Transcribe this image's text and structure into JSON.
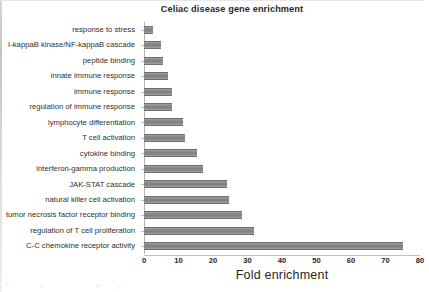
{
  "chart_data": {
    "type": "bar",
    "orientation": "horizontal",
    "title": "Celiac disease gene enrichment",
    "xlabel": "Fold enrichment",
    "ylabel": "",
    "xlim": [
      0,
      80
    ],
    "xticks": [
      0,
      10,
      20,
      30,
      40,
      50,
      60,
      70,
      80
    ],
    "grid": false,
    "legend": null,
    "bar_color": "#8a8a8a",
    "categories": [
      "response to stress",
      "I-kappaB kinase/NF-kappaB cascade",
      "peptide binding",
      "innate immune response",
      "immune response",
      "regulation of immune response",
      "lymphocyte differentiation",
      "T cell activation",
      "cytokine binding",
      "interferon-gamma production",
      "JAK-STAT cascade",
      "natural killer cell activation",
      "tumor necrosis factor receptor binding",
      "regulation of T cell proliferation",
      "C-C chemokine receptor activity"
    ],
    "values": [
      2.5,
      5,
      5.5,
      7,
      8,
      8.2,
      11.2,
      12,
      15.5,
      17,
      24,
      24.5,
      28.5,
      32,
      75
    ]
  }
}
